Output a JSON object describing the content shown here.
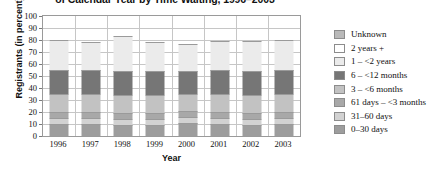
{
  "chart_data": {
    "type": "bar",
    "subtype": "stacked-bar-100-percent",
    "title": "of Calendar Year by Time Waiting, 1996–2003",
    "xlabel": "Year",
    "ylabel": "Registrants (in percent)",
    "ylim": [
      0,
      100
    ],
    "ytick_values": [
      0,
      10,
      20,
      30,
      40,
      50,
      60,
      70,
      80,
      90,
      100
    ],
    "ytick_labels": [
      "0",
      "10",
      "20",
      "30",
      "40",
      "50",
      "60",
      "70",
      "80",
      "90",
      "100"
    ],
    "grid": true,
    "grid_axis": "both",
    "legend_position": "right",
    "categories": [
      "1996",
      "1997",
      "1998",
      "1999",
      "2000",
      "2001",
      "2002",
      "2003"
    ],
    "stack_order_bottom_to_top": [
      "0–30 days",
      "31–60 days",
      "61 days – <3 months",
      "3 – <6 months",
      "6 – <12 months",
      "1 – <2 years",
      "2 years +",
      "Unknown"
    ],
    "series": [
      {
        "name": "0–30 days",
        "color": "#9d9d9d",
        "values": [
          10,
          10,
          9,
          9,
          11,
          10,
          9,
          10
        ]
      },
      {
        "name": "31–60 days",
        "color": "#d2d2d2",
        "values": [
          5,
          5,
          5,
          5,
          5,
          5,
          5,
          5
        ]
      },
      {
        "name": "61 days – <3 months",
        "color": "#a8a8a8",
        "values": [
          5,
          5,
          5,
          5,
          5,
          5,
          5,
          5
        ]
      },
      {
        "name": "3 – <6 months",
        "color": "#c2c2c2",
        "values": [
          15,
          15,
          15,
          15,
          14,
          15,
          15,
          15
        ]
      },
      {
        "name": "6 – <12 months",
        "color": "#767676",
        "values": [
          20,
          20,
          20,
          20,
          19,
          20,
          20,
          20
        ]
      },
      {
        "name": "1 – <2 years",
        "color": "#ebebeb",
        "values": [
          25,
          23,
          29,
          24,
          23,
          24,
          25,
          25
        ]
      },
      {
        "name": "2 years +",
        "color": "#ffffff",
        "values": [
          0,
          0,
          0,
          0,
          0,
          0,
          0,
          0
        ]
      },
      {
        "name": "Unknown",
        "color": "#b9b9b9",
        "values": [
          0,
          0,
          0,
          0,
          0,
          0,
          0,
          0
        ]
      }
    ],
    "legend_entries": [
      {
        "label": "Unknown",
        "color": "#b9b9b9"
      },
      {
        "label": "2 years +",
        "color": "#ffffff"
      },
      {
        "label": "1 – <2 years",
        "color": "#ebebeb"
      },
      {
        "label": "6 – <12 months",
        "color": "#767676"
      },
      {
        "label": "3 – <6 months",
        "color": "#c2c2c2"
      },
      {
        "label": "61 days – <3 months",
        "color": "#a8a8a8"
      },
      {
        "label": "31–60 days",
        "color": "#d2d2d2"
      },
      {
        "label": "0–30 days",
        "color": "#9d9d9d"
      }
    ]
  }
}
